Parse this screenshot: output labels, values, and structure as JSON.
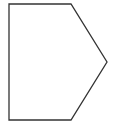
{
  "diagram": {
    "shape": "pentagon",
    "stroke_color": "#333333",
    "fill_color": "#ffffff",
    "stroke_width": 1.3,
    "points": "9,4 71,4 107,62 71,120 9,120"
  }
}
